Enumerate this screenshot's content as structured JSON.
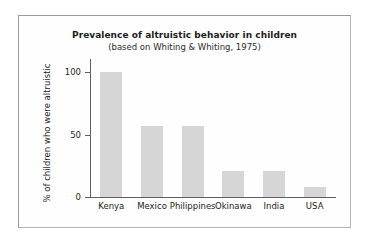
{
  "chart_data": {
    "type": "bar",
    "title": "Prevalence of altruistic behavior in children",
    "subtitle": "(based on Whiting & Whiting, 1975)",
    "xlabel": "",
    "ylabel": "% of children who were altruistic",
    "categories": [
      "Kenya",
      "Mexico",
      "Philippines",
      "Okinawa",
      "India",
      "USA"
    ],
    "values": [
      100,
      57,
      57,
      21,
      21,
      8
    ],
    "ylim": [
      0,
      110
    ],
    "yticks": [
      0,
      50,
      100
    ],
    "ytick_labels": [
      "0",
      "50",
      "100"
    ],
    "grid": false,
    "legend": false,
    "bar_color": "#d6d6d6",
    "axis_color": "#5f5f5f",
    "frame_color": "#9a9a9a",
    "background_color": "#fefefe"
  }
}
